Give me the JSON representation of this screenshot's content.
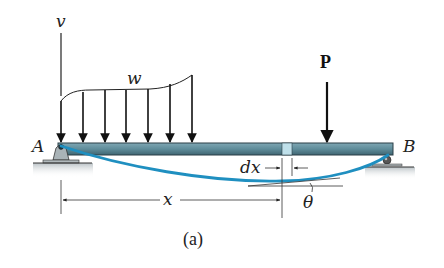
{
  "figure": {
    "caption": "(a)",
    "labels": {
      "vertical_axis": "v",
      "distributed_load": "w",
      "point_load": "P",
      "support_left": "A",
      "support_right": "B",
      "position": "x",
      "element_width": "dx",
      "slope_angle": "θ"
    },
    "colors": {
      "beam_fill": "#5f8c9a",
      "beam_dark": "#2b3f47",
      "element_fill": "#bfe0ea",
      "deflection_curve": "#1f8fc0",
      "support_fill": "#a9b3b7",
      "ground_shadow": "#c9cfd2",
      "line": "#222222"
    }
  }
}
